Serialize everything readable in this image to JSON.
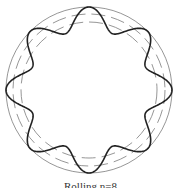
{
  "figure": {
    "caption": "Rolling n=8",
    "center": [
      89,
      90
    ],
    "circles": [
      {
        "name": "outer",
        "r": 83,
        "style": "solid",
        "color": "#8a8a8a"
      },
      {
        "name": "middle",
        "r": 76,
        "style": "dashed",
        "color": "#8a8a8a"
      },
      {
        "name": "inner",
        "r": 68,
        "style": "dashed",
        "color": "#8a8a8a"
      }
    ],
    "wave": {
      "lobes": 8,
      "r_mean": 72,
      "amplitude": 11,
      "phase_deg": -90,
      "color": "#222222"
    }
  }
}
